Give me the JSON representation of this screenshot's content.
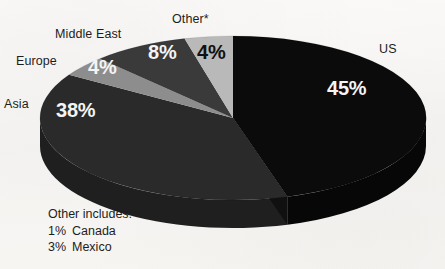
{
  "chart_data": {
    "type": "pie",
    "title": "",
    "subtitle": "",
    "xlabel": "",
    "ylabel": "",
    "legend_position": "labels-outside",
    "grid": false,
    "categories": [
      "US",
      "Other*",
      "Middle East",
      "Europe",
      "Asia"
    ],
    "values": [
      45,
      4,
      8,
      4,
      38
    ],
    "labels": [
      "45%",
      "4%",
      "8%",
      "4%",
      "38%"
    ],
    "slices": [
      {
        "name": "US",
        "label": "US",
        "value": 45,
        "value_label": "45%",
        "color": "#0b0b0b",
        "value_text_color": "#f4f4f4"
      },
      {
        "name": "Other",
        "label": "Other*",
        "value": 4,
        "value_label": "4%",
        "color": "#b9b9b9",
        "value_text_color": "#111111"
      },
      {
        "name": "Middle East",
        "label": "Middle East",
        "value": 8,
        "value_label": "8%",
        "color": "#3a3a3a",
        "value_text_color": "#f4f4f4"
      },
      {
        "name": "Europe",
        "label": "Europe",
        "value": 4,
        "value_label": "4%",
        "color": "#8d8d8d",
        "value_text_color": "#f4f4f4"
      },
      {
        "name": "Asia",
        "label": "Asia",
        "value": 38,
        "value_label": "38%",
        "color": "#2a2a2a",
        "value_text_color": "#f4f4f4"
      }
    ],
    "annotations": {
      "footnote_title": "Other includes:",
      "footnote_items": [
        {
          "percent": "1%",
          "label": "Canada"
        },
        {
          "percent": "3%",
          "label": "Mexico"
        }
      ]
    },
    "colors": {
      "background": "#f7f6f4",
      "us": "#0b0b0b",
      "asia": "#2a2a2a",
      "middle_east": "#3a3a3a",
      "europe": "#8d8d8d",
      "other": "#b9b9b9",
      "text": "#1d1d1d"
    }
  },
  "labels": {
    "us": "US",
    "other": "Other*",
    "middle_east": "Middle East",
    "europe": "Europe",
    "asia": "Asia"
  },
  "values": {
    "us": "45%",
    "other": "4%",
    "middle_east": "8%",
    "europe": "4%",
    "asia": "38%"
  },
  "footnote": {
    "title": "Other includes:",
    "canada_pct": "1%",
    "canada_label": "Canada",
    "mexico_pct": "3%",
    "mexico_label": "Mexico"
  }
}
